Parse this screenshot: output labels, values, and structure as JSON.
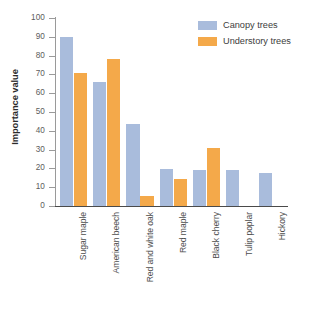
{
  "chart_data": {
    "type": "bar",
    "title": "",
    "subtitle": "",
    "xlabel": "",
    "ylabel": "Importance value",
    "ylim": [
      0,
      100
    ],
    "ytick_step": 10,
    "yticks": [
      0,
      10,
      20,
      30,
      40,
      50,
      60,
      70,
      80,
      90,
      100
    ],
    "ytick_labels": [
      "0",
      "10",
      "20",
      "30",
      "40",
      "50",
      "60",
      "70",
      "80",
      "90",
      "100"
    ],
    "grid": false,
    "legend_position": "top-right",
    "categories": [
      "Sugar maple",
      "American beech",
      "Red and white oak",
      "Red maple",
      "Black cherry",
      "Tulip poplar",
      "Hickory"
    ],
    "series": [
      {
        "name": "Canopy trees",
        "color": "#a9bcdc",
        "values": [
          90,
          66,
          43.5,
          19.5,
          19,
          19,
          17.5
        ]
      },
      {
        "name": "Understory trees",
        "color": "#f4a94a",
        "values": [
          71,
          78,
          5.5,
          14.5,
          31,
          0,
          0
        ]
      }
    ]
  },
  "legend": {
    "items": [
      {
        "label": "Canopy trees",
        "swatch": "canopy"
      },
      {
        "label": "Understory trees",
        "swatch": "under"
      }
    ]
  },
  "colors": {
    "canopy": "#a9bcdc",
    "understory": "#f4a94a",
    "axis": "#4a4a4a",
    "tick": "#9a9a9a",
    "text": "#3d3d3d",
    "background": "#ffffff"
  }
}
